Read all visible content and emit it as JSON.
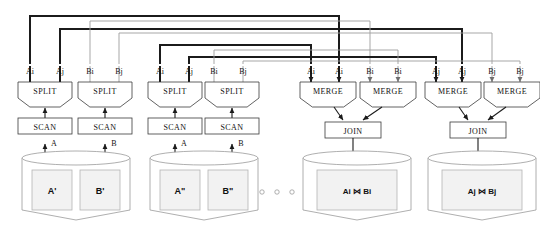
{
  "diagram": {
    "colors": {
      "route_a": "#1b1b1b",
      "route_b": "#9d9d9d",
      "box_stroke": "#3a3a3a",
      "cylinder_stroke": "#9a9a9a",
      "slot_fill": "#f2f2f2",
      "background": "#ffffff"
    },
    "ellipsis": "o o o",
    "operators": {
      "split": "SPLIT",
      "scan": "SCAN",
      "merge": "MERGE",
      "join": "JOIN"
    },
    "join_symbol": "⋈",
    "columns": [
      {
        "id": "c1",
        "label": "Ai",
        "x": 30,
        "route": "a"
      },
      {
        "id": "c2",
        "label": "Aj",
        "x": 60,
        "route": "a"
      },
      {
        "id": "c3",
        "label": "Bi",
        "x": 90,
        "route": "b"
      },
      {
        "id": "c4",
        "label": "Bj",
        "x": 119,
        "route": "b"
      },
      {
        "id": "c5",
        "label": "Ai",
        "x": 160,
        "route": "a"
      },
      {
        "id": "c6",
        "label": "Aj",
        "x": 189,
        "route": "a"
      },
      {
        "id": "c7",
        "label": "Bi",
        "x": 214,
        "route": "b"
      },
      {
        "id": "c8",
        "label": "Bj",
        "x": 243,
        "route": "b"
      },
      {
        "id": "c9",
        "label": "Ai",
        "x": 311,
        "route": "a"
      },
      {
        "id": "c10",
        "label": "Ai",
        "x": 339,
        "route": "a"
      },
      {
        "id": "c11",
        "label": "Bi",
        "x": 370,
        "route": "b"
      },
      {
        "id": "c12",
        "label": "Bi",
        "x": 398,
        "route": "b"
      },
      {
        "id": "c13",
        "label": "Aj",
        "x": 436,
        "route": "a"
      },
      {
        "id": "c14",
        "label": "Aj",
        "x": 462,
        "route": "a"
      },
      {
        "id": "c15",
        "label": "Bj",
        "x": 492,
        "route": "b"
      },
      {
        "id": "c16",
        "label": "Bj",
        "x": 520,
        "route": "b"
      }
    ],
    "groups": [
      {
        "id": "g1",
        "kind": "source",
        "ops": [
          {
            "name": "SPLIT",
            "x": 18,
            "w": 54
          },
          {
            "name": "SPLIT",
            "x": 78,
            "w": 54
          }
        ],
        "scans": [
          {
            "name": "SCAN",
            "x": 18,
            "w": 54,
            "feed": "A"
          },
          {
            "name": "SCAN",
            "x": 78,
            "w": 54,
            "feed": "B"
          }
        ],
        "store": {
          "x": 22,
          "w": 108,
          "partitions": [
            "A'",
            "B'"
          ]
        }
      },
      {
        "id": "g2",
        "kind": "source",
        "ops": [
          {
            "name": "SPLIT",
            "x": 148,
            "w": 54
          },
          {
            "name": "SPLIT",
            "x": 205,
            "w": 54
          }
        ],
        "scans": [
          {
            "name": "SCAN",
            "x": 148,
            "w": 54,
            "feed": "A"
          },
          {
            "name": "SCAN",
            "x": 205,
            "w": 54,
            "feed": "B"
          }
        ],
        "store": {
          "x": 150,
          "w": 108,
          "partitions": [
            "A\"",
            "B\""
          ]
        }
      },
      {
        "id": "g3",
        "kind": "result",
        "ops": [
          {
            "name": "MERGE",
            "x": 300,
            "w": 56
          },
          {
            "name": "MERGE",
            "x": 360,
            "w": 56
          }
        ],
        "join": {
          "name": "JOIN",
          "x": 325,
          "w": 56
        },
        "store": {
          "x": 303,
          "w": 108,
          "result_left": "Ai",
          "result_right": "Bi"
        }
      },
      {
        "id": "g4",
        "kind": "result",
        "ops": [
          {
            "name": "MERGE",
            "x": 425,
            "w": 56
          },
          {
            "name": "MERGE",
            "x": 484,
            "w": 56
          }
        ],
        "join": {
          "name": "JOIN",
          "x": 450,
          "w": 56
        },
        "store": {
          "x": 428,
          "w": 108,
          "result_left": "Aj",
          "result_right": "Bj"
        }
      }
    ],
    "routes": [
      {
        "id": "r1",
        "from_x": 30,
        "to_x": 339,
        "y": 16,
        "route": "a"
      },
      {
        "id": "r2",
        "from_x": 60,
        "to_x": 462,
        "y": 29,
        "route": "a"
      },
      {
        "id": "r3",
        "from_x": 90,
        "to_x": 370,
        "y": 21,
        "route": "b"
      },
      {
        "id": "r4",
        "from_x": 119,
        "to_x": 492,
        "y": 33,
        "route": "b"
      },
      {
        "id": "r5",
        "from_x": 160,
        "to_x": 311,
        "y": 45,
        "route": "a"
      },
      {
        "id": "r6",
        "from_x": 189,
        "to_x": 436,
        "y": 57,
        "route": "a"
      },
      {
        "id": "r7",
        "from_x": 214,
        "to_x": 398,
        "y": 50,
        "route": "b"
      },
      {
        "id": "r8",
        "from_x": 243,
        "to_x": 520,
        "y": 61,
        "route": "b"
      }
    ]
  }
}
